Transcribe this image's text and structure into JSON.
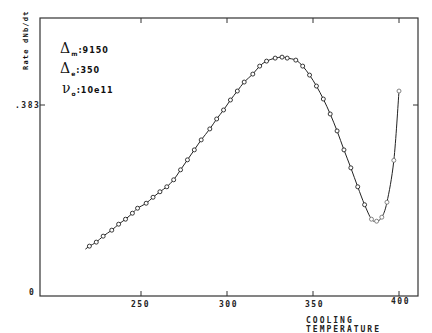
{
  "chart_data": {
    "type": "line",
    "title": "",
    "xlabel": "COOLING TEMPERATURE",
    "ylabel": "Rate  dNb/dt",
    "xlim": [
      200,
      410
    ],
    "ylim": [
      0,
      0.55
    ],
    "xticks": [
      250,
      300,
      350,
      400
    ],
    "xtick_labels": [
      "250",
      "300",
      "350",
      "400"
    ],
    "yticks": [
      0,
      0.383
    ],
    "ytick_labels": [
      "0",
      ".383"
    ],
    "grid": false,
    "legend": null,
    "annotations": [
      {
        "symbol": "Δ",
        "sub": "m",
        "value": ":9150"
      },
      {
        "symbol": "Δ",
        "sub": "e",
        "value": ":350"
      },
      {
        "symbol": "ν",
        "sub": "o",
        "value": ":10e11"
      }
    ],
    "series": [
      {
        "name": "dNb/dt",
        "marker": "circle",
        "x": [
          220,
          224,
          228,
          233,
          237,
          241,
          245,
          248,
          253,
          257,
          261,
          265,
          269,
          273,
          277,
          281,
          285,
          290,
          294,
          298,
          302,
          306,
          310,
          315,
          319,
          323,
          328,
          332,
          335,
          340,
          344,
          348,
          352,
          356,
          360,
          364,
          368,
          372,
          376,
          380,
          384,
          387,
          390,
          393,
          397,
          400
        ],
        "y": [
          0.1,
          0.108,
          0.12,
          0.132,
          0.144,
          0.154,
          0.166,
          0.176,
          0.186,
          0.198,
          0.209,
          0.219,
          0.233,
          0.253,
          0.273,
          0.293,
          0.313,
          0.335,
          0.355,
          0.373,
          0.393,
          0.411,
          0.429,
          0.445,
          0.461,
          0.471,
          0.477,
          0.479,
          0.477,
          0.473,
          0.461,
          0.443,
          0.421,
          0.395,
          0.365,
          0.331,
          0.293,
          0.257,
          0.219,
          0.183,
          0.154,
          0.15,
          0.158,
          0.188,
          0.272,
          0.411
        ]
      }
    ]
  },
  "labels": {
    "xlabel": "COOLING TEMPERATURE",
    "ylabel": "Rate  dNb/dt",
    "xticks": [
      "250",
      "300",
      "350",
      "400"
    ],
    "yticks": [
      "0",
      ".383"
    ],
    "params": [
      {
        "symbol": "Δ",
        "sub": "m",
        "value": ":9150"
      },
      {
        "symbol": "Δ",
        "sub": "e",
        "value": ":350"
      },
      {
        "symbol": "ν",
        "sub": "o",
        "value": ":10e11"
      }
    ]
  }
}
